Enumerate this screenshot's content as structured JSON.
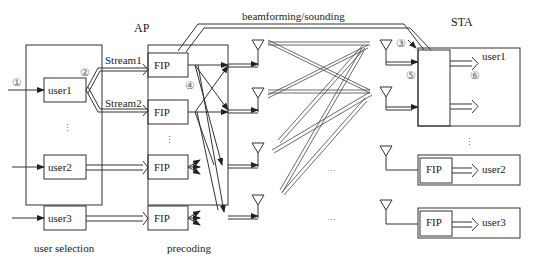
{
  "title_ap": "AP",
  "title_sta": "STA",
  "feedback_label": "beamforming/sounding",
  "ap": {
    "user_selection": {
      "caption": "user selection",
      "users": [
        "user1",
        "user2",
        "user3"
      ],
      "ellipsis": "⋮"
    },
    "streams": [
      "Stream1",
      "Stream2"
    ],
    "precoding": {
      "caption": "precoding",
      "blocks": [
        "FIP",
        "FIP",
        "FIP",
        "FIP"
      ],
      "ellipsis": "⋮"
    }
  },
  "channel": {
    "ellipsis": [
      "···",
      "···"
    ]
  },
  "sta": {
    "user1": {
      "label": "user1"
    },
    "user2": {
      "block": "FIP",
      "label": "user2"
    },
    "user3": {
      "block": "FIP",
      "label": "user3"
    },
    "ellipsis": "⋮"
  },
  "markers": [
    "①",
    "②",
    "③",
    "④",
    "⑤",
    "⑥"
  ],
  "colors": {
    "line": "#333333",
    "marker": "#666666",
    "background": "#ffffff"
  }
}
